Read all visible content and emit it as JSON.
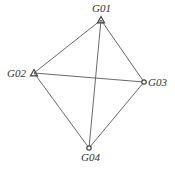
{
  "diagram": {
    "type": "network-graph",
    "nodes": [
      {
        "id": "G01",
        "label": "G01",
        "shape": "triangle",
        "x": 101,
        "y": 20,
        "label_x": 92,
        "label_y": 12
      },
      {
        "id": "G02",
        "label": "G02",
        "shape": "triangle",
        "x": 34,
        "y": 73,
        "label_x": 7,
        "label_y": 77
      },
      {
        "id": "G03",
        "label": "G03",
        "shape": "circle",
        "x": 144,
        "y": 82,
        "label_x": 148,
        "label_y": 86
      },
      {
        "id": "G04",
        "label": "G04",
        "shape": "circle",
        "x": 89,
        "y": 148,
        "label_x": 81,
        "label_y": 161
      }
    ],
    "edges": [
      {
        "from": "G01",
        "to": "G02"
      },
      {
        "from": "G01",
        "to": "G03"
      },
      {
        "from": "G01",
        "to": "G04"
      },
      {
        "from": "G02",
        "to": "G03"
      },
      {
        "from": "G02",
        "to": "G04"
      },
      {
        "from": "G03",
        "to": "G04"
      }
    ],
    "colors": {
      "edge": "#6a6a6a",
      "node": "#444444",
      "label": "#333333"
    }
  }
}
